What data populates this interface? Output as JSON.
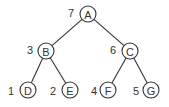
{
  "diagram": {
    "type": "binary-tree",
    "nodes": [
      {
        "id": "A",
        "label": "A",
        "order": "7",
        "cx": 88,
        "cy": 14,
        "ox": 71,
        "oy": 12
      },
      {
        "id": "B",
        "label": "B",
        "order": "3",
        "cx": 46,
        "cy": 51,
        "ox": 30,
        "oy": 49
      },
      {
        "id": "C",
        "label": "C",
        "order": "6",
        "cx": 130,
        "cy": 51,
        "ox": 113,
        "oy": 49
      },
      {
        "id": "D",
        "label": "D",
        "order": "1",
        "cx": 28,
        "cy": 90,
        "ox": 11,
        "oy": 90
      },
      {
        "id": "E",
        "label": "E",
        "order": "2",
        "cx": 70,
        "cy": 90,
        "ox": 53,
        "oy": 90
      },
      {
        "id": "F",
        "label": "F",
        "order": "4",
        "cx": 108,
        "cy": 90,
        "ox": 94,
        "oy": 90
      },
      {
        "id": "G",
        "label": "G",
        "order": "5",
        "cx": 151,
        "cy": 90,
        "ox": 136,
        "oy": 90
      }
    ],
    "edges": [
      {
        "from": "A",
        "to": "B"
      },
      {
        "from": "A",
        "to": "C"
      },
      {
        "from": "B",
        "to": "D"
      },
      {
        "from": "B",
        "to": "E"
      },
      {
        "from": "C",
        "to": "F"
      },
      {
        "from": "C",
        "to": "G"
      }
    ],
    "radius": 8,
    "colors": {
      "stroke": "#333333",
      "fill": "#ffffff",
      "text": "#333333"
    }
  }
}
